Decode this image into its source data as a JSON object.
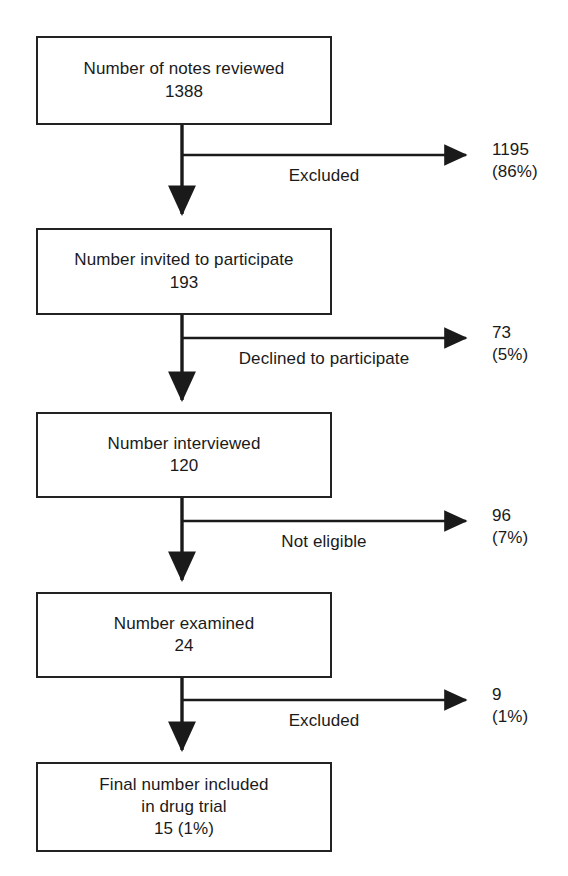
{
  "figure": {
    "type": "flow-diagram",
    "background_color": "#ffffff",
    "line_color": "#222222",
    "text_color": "#1a1a1a"
  },
  "nodes": [
    {
      "id": "notes-reviewed",
      "lines": [
        "Number of notes reviewed",
        "1388"
      ],
      "count": 1388
    },
    {
      "id": "invited-to-participate",
      "lines": [
        "Number invited to participate",
        "193"
      ],
      "count": 193
    },
    {
      "id": "interviewed",
      "lines": [
        "Number interviewed",
        "120"
      ],
      "count": 120
    },
    {
      "id": "examined",
      "lines": [
        "Number examined",
        "24"
      ],
      "count": 24
    },
    {
      "id": "final-included",
      "lines": [
        "Final number included",
        "in drug trial",
        "15 (1%)"
      ],
      "count": 15,
      "percent": "1%"
    }
  ],
  "branches": [
    {
      "id": "excluded-1",
      "label": "Excluded",
      "value": "1195",
      "percent": "(86%)"
    },
    {
      "id": "declined",
      "label": "Declined to participate",
      "value": "73",
      "percent": "(5%)"
    },
    {
      "id": "not-eligible",
      "label": "Not eligible",
      "value": "96",
      "percent": "(7%)"
    },
    {
      "id": "excluded-2",
      "label": "Excluded",
      "value": "9",
      "percent": "(1%)"
    }
  ]
}
